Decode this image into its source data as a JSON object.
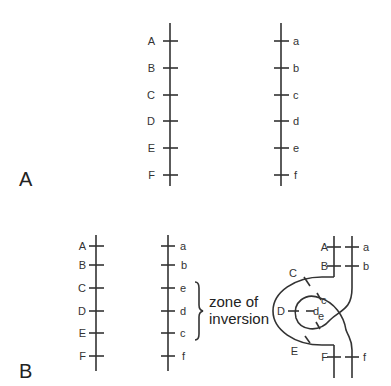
{
  "panel_a": {
    "label": "A",
    "left_chromosome": [
      "A",
      "B",
      "C",
      "D",
      "E",
      "F"
    ],
    "right_chromosome": [
      "a",
      "b",
      "c",
      "d",
      "e",
      "f"
    ]
  },
  "panel_b": {
    "label": "B",
    "left_chromosome": [
      "A",
      "B",
      "C",
      "D",
      "E",
      "F"
    ],
    "right_chromosome": [
      "a",
      "b",
      "e",
      "d",
      "c",
      "f"
    ],
    "bracket_label_line1": "zone of",
    "bracket_label_line2": "inversion",
    "loop": {
      "outer_labels": [
        "A",
        "B",
        "C",
        "D",
        "E",
        "F"
      ],
      "inner_labels": [
        "c",
        "d",
        "e"
      ],
      "right_labels": [
        "a",
        "b",
        "f"
      ]
    }
  }
}
